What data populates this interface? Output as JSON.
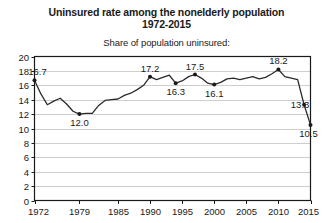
{
  "chart_data": {
    "type": "line",
    "title": "Uninsured rate among the nonelderly population",
    "subtitle_line2": "1972-2015",
    "axis_note": "Share of population uninsured:",
    "xlabel": "",
    "ylabel": "",
    "grid": true,
    "legend": "none",
    "xlim": [
      1972,
      2015
    ],
    "ylim": [
      0,
      20
    ],
    "ytick_step": 2,
    "yticks": [
      "0",
      "2",
      "4",
      "6",
      "8",
      "10",
      "12",
      "14",
      "16",
      "18",
      "20"
    ],
    "xticks": [
      "1972",
      "1979",
      "1985",
      "1990",
      "1995",
      "2000",
      "2005",
      "2010",
      "2015"
    ],
    "x": [
      1972,
      1973,
      1974,
      1975,
      1976,
      1977,
      1978,
      1979,
      1980,
      1981,
      1982,
      1983,
      1984,
      1985,
      1986,
      1987,
      1988,
      1989,
      1990,
      1991,
      1992,
      1993,
      1994,
      1995,
      1996,
      1997,
      1998,
      1999,
      2000,
      2001,
      2002,
      2003,
      2004,
      2005,
      2006,
      2007,
      2008,
      2009,
      2010,
      2011,
      2012,
      2013,
      2014,
      2015
    ],
    "values": [
      16.7,
      14.8,
      13.3,
      13.8,
      14.2,
      13.4,
      12.4,
      12.0,
      12.1,
      12.1,
      13.2,
      13.9,
      14.0,
      14.1,
      14.6,
      14.9,
      15.4,
      16.0,
      17.2,
      16.8,
      17.1,
      17.4,
      16.3,
      16.6,
      17.2,
      17.5,
      17.0,
      16.3,
      16.1,
      16.4,
      16.9,
      17.0,
      16.8,
      17.0,
      17.2,
      16.9,
      17.1,
      17.6,
      18.2,
      17.2,
      17.0,
      16.8,
      13.3,
      10.5
    ],
    "labeled_points": [
      {
        "year": 1972,
        "value": 16.7,
        "label": "16.7",
        "pos": "right"
      },
      {
        "year": 1979,
        "value": 12.0,
        "label": "12.0",
        "pos": "below"
      },
      {
        "year": 1990,
        "value": 17.2,
        "label": "17.2",
        "pos": "above"
      },
      {
        "year": 1994,
        "value": 16.3,
        "label": "16.3",
        "pos": "below"
      },
      {
        "year": 1997,
        "value": 17.5,
        "label": "17.5",
        "pos": "above"
      },
      {
        "year": 2000,
        "value": 16.1,
        "label": "16.1",
        "pos": "below"
      },
      {
        "year": 2010,
        "value": 18.2,
        "label": "18.2",
        "pos": "above"
      },
      {
        "year": 2014,
        "value": 13.3,
        "label": "13.3",
        "pos": "left"
      },
      {
        "year": 2015,
        "value": 10.5,
        "label": "10.5",
        "pos": "belowleft"
      }
    ],
    "colors": {
      "line": "#2b2b2b",
      "marker": "#1a1a1a",
      "grid": "#c8c8c8",
      "frame": "#1a1a1a",
      "background": "#ffffff",
      "text": "#1a1a1a"
    }
  }
}
